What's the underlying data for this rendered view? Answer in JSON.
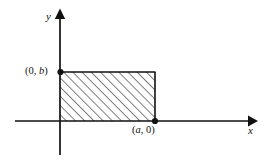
{
  "figure": {
    "type": "coordinate-plane-diagram",
    "background_color": "#ffffff",
    "stroke_color": "#111111",
    "axes": {
      "x_axis": {
        "label": "x",
        "from_px": [
          15,
          121
        ],
        "to_px": [
          255,
          121
        ],
        "arrow": "right"
      },
      "y_axis": {
        "label": "y",
        "from_px": [
          60,
          155
        ],
        "to_px": [
          60,
          10
        ],
        "arrow": "up"
      },
      "origin_px": [
        60,
        121
      ]
    },
    "shape": {
      "name": "rectangle",
      "fill": "hatched",
      "hatch_direction": "45-degree-up-right",
      "hatch_spacing_px": 6.5,
      "hatch_color": "#222222",
      "outline_color": "#111111",
      "left_px": 60,
      "top_px": 72,
      "right_px": 155,
      "bottom_px": 121,
      "corners": [
        "(0, 0)",
        "(a, 0)",
        "(a, b)",
        "(0, b)"
      ]
    },
    "points": [
      {
        "name": "y-intercept-point",
        "label_prefix": "(0, ",
        "label_var": "b",
        "label_suffix": ")",
        "label_full": "(0, b)",
        "marker": "filled-dot",
        "at_px": [
          60,
          72
        ]
      },
      {
        "name": "x-intercept-point",
        "label_prefix": "(",
        "label_var": "a",
        "label_suffix": ", 0)",
        "label_full": "(a, 0)",
        "marker": "filled-dot",
        "at_px": [
          155,
          121
        ]
      }
    ]
  }
}
